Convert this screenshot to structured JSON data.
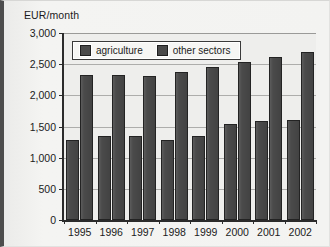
{
  "chart_data": {
    "type": "bar",
    "title": "",
    "subtitle": "",
    "xlabel": "",
    "ylabel": "EUR/month",
    "categories": [
      "1995",
      "1996",
      "1997",
      "1998",
      "1999",
      "2000",
      "2001",
      "2002"
    ],
    "series": [
      {
        "name": "agriculture",
        "color": "#4a4a4a",
        "values": [
          1290,
          1350,
          1350,
          1280,
          1350,
          1540,
          1590,
          1610
        ]
      },
      {
        "name": "other sectors",
        "color": "#4a4a4a",
        "values": [
          2320,
          2320,
          2310,
          2370,
          2450,
          2530,
          2610,
          2700
        ]
      }
    ],
    "ylim": [
      0,
      3000
    ],
    "ytick_values": [
      0,
      500,
      1000,
      1500,
      2000,
      2500,
      3000
    ],
    "ytick_labels": [
      "0",
      "500",
      "1,000",
      "1,500",
      "2,000",
      "2,500",
      "3,000"
    ],
    "grid": true,
    "legend_position": "top-left-inside"
  },
  "legend": {
    "entries": [
      {
        "label": "agriculture",
        "swatch": "legend-swatch-agriculture"
      },
      {
        "label": "other sectors",
        "swatch": "legend-swatch-other-sectors"
      }
    ]
  },
  "colors": {
    "bar_fill": "#4a4a4a",
    "bar_stroke": "#232323",
    "axis": "#2b2b2b",
    "gridline": "#adadab",
    "plot_background": "#eeeeec",
    "figure_background": "#f3f3f1",
    "frame_left": "#4d4d4d",
    "text": "#1b1b1b"
  }
}
